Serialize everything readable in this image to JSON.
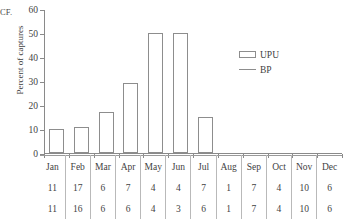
{
  "figure": {
    "caption_fragment": "CF."
  },
  "axes": {
    "y_title": "Percent of captures",
    "y_ticks": [
      "0",
      "10",
      "20",
      "30",
      "40",
      "50",
      "60"
    ],
    "y_min": 0,
    "y_max": 60
  },
  "legend": {
    "entries": [
      {
        "label": "UPU",
        "marker": "open-rectangle",
        "color": "#8d8d8d"
      },
      {
        "label": "BP",
        "marker": "line",
        "color": "#8d8d8d"
      }
    ]
  },
  "table": {
    "months": [
      "Jan",
      "Feb",
      "Mar",
      "Apr",
      "May",
      "Jun",
      "Jul",
      "Aug",
      "Sep",
      "Oct",
      "Nov",
      "Dec"
    ],
    "row1": [
      "11",
      "17",
      "6",
      "7",
      "4",
      "4",
      "7",
      "1",
      "7",
      "4",
      "10",
      "6"
    ],
    "row2": [
      "11",
      "16",
      "6",
      "6",
      "4",
      "3",
      "6",
      "1",
      "7",
      "4",
      "10",
      "6"
    ]
  },
  "chart_data": {
    "type": "bar",
    "title": "",
    "xlabel": "",
    "ylabel": "Percent of captures",
    "ylim": [
      0,
      60
    ],
    "ytick_step": 10,
    "grid": false,
    "legend_position": "center-right",
    "categories": [
      "Jan",
      "Feb",
      "Mar",
      "Apr",
      "May",
      "Jun",
      "Jul",
      "Aug",
      "Sep",
      "Oct",
      "Nov",
      "Dec"
    ],
    "series": [
      {
        "name": "UPU",
        "type": "bar",
        "values": [
          10,
          11,
          17,
          29,
          50,
          50,
          15,
          0,
          0,
          0,
          0,
          0
        ]
      },
      {
        "name": "BP",
        "type": "line",
        "values": [
          0,
          0,
          0,
          0,
          0,
          0,
          0,
          0,
          0,
          0,
          0,
          0
        ]
      }
    ],
    "sample_sizes": {
      "UPU": [
        11,
        17,
        6,
        7,
        4,
        4,
        7,
        1,
        7,
        4,
        10,
        6
      ],
      "BP": [
        11,
        16,
        6,
        6,
        4,
        3,
        6,
        1,
        7,
        4,
        10,
        6
      ]
    }
  }
}
